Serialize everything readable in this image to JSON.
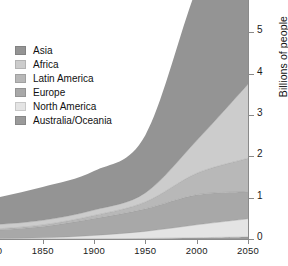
{
  "chart_data": {
    "type": "area",
    "title": "",
    "subtitle": "",
    "xlabel": "",
    "ylabel": "Billions of people",
    "stacked": true,
    "grid": false,
    "legend_position": "top-left",
    "xlim": [
      1750,
      2050
    ],
    "ylim": [
      0,
      6
    ],
    "xticks": [
      1800,
      1850,
      1900,
      1950,
      2000,
      2050
    ],
    "yticks": [
      0,
      1,
      2,
      3,
      4,
      5,
      6
    ],
    "xtick_labels": [
      "1800",
      "1850",
      "1900",
      "1950",
      "2000",
      "2050"
    ],
    "ytick_labels": [
      "0",
      "1",
      "2",
      "3",
      "4",
      "5",
      "6"
    ],
    "x": [
      1750,
      1800,
      1850,
      1900,
      1950,
      2000,
      2050
    ],
    "series": [
      {
        "name": "Australia/Oceania",
        "color": "#9a9a9a",
        "values": [
          0.002,
          0.002,
          0.002,
          0.006,
          0.013,
          0.031,
          0.05
        ]
      },
      {
        "name": "North America",
        "color": "#e4e4e4",
        "values": [
          0.002,
          0.007,
          0.026,
          0.082,
          0.172,
          0.314,
          0.44
        ]
      },
      {
        "name": "Europe",
        "color": "#a8a8a8",
        "values": [
          0.163,
          0.203,
          0.276,
          0.408,
          0.547,
          0.729,
          0.66
        ]
      },
      {
        "name": "Latin America",
        "color": "#b8b8b8",
        "values": [
          0.016,
          0.024,
          0.038,
          0.074,
          0.167,
          0.521,
          0.81
        ]
      },
      {
        "name": "Africa",
        "color": "#cccccc",
        "values": [
          0.106,
          0.107,
          0.111,
          0.133,
          0.221,
          0.796,
          1.8
        ]
      },
      {
        "name": "Asia",
        "color": "#949494",
        "values": [
          0.502,
          0.635,
          0.809,
          0.947,
          1.402,
          3.7,
          5.22
        ]
      }
    ]
  },
  "legend": {
    "items": [
      {
        "label": "Asia",
        "color": "#949494"
      },
      {
        "label": "Africa",
        "color": "#cccccc"
      },
      {
        "label": "Latin America",
        "color": "#b8b8b8"
      },
      {
        "label": "Europe",
        "color": "#a8a8a8"
      },
      {
        "label": "North America",
        "color": "#e4e4e4"
      },
      {
        "label": "Australia/Oceania",
        "color": "#9a9a9a"
      }
    ]
  },
  "axes": {
    "y_title": "Billions of people",
    "y_labels": [
      "6",
      "5",
      "4",
      "3",
      "2",
      "1",
      "0"
    ],
    "x_labels": [
      "1800",
      "1850",
      "1900",
      "1950",
      "2000",
      "2050"
    ]
  },
  "colors": {
    "axis": "#8a8a8a",
    "text": "#111111",
    "background": "#ffffff"
  }
}
